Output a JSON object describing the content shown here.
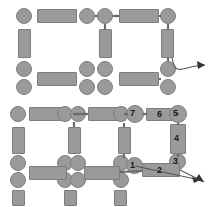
{
  "figure": {
    "background_color": "#ffffff",
    "shape_fill": "#9a9a9a",
    "shape_stroke": "#7d7d7d",
    "connector_color": "#6b6b6b",
    "label_color": "#1a1a1a"
  },
  "panels": [
    {
      "id": "top-panel",
      "name": "upper-layout-diagram",
      "has_labels": false,
      "shapes": [
        {
          "kind": "circle",
          "x": 16,
          "y": 8,
          "w": 16,
          "h": 16
        },
        {
          "kind": "rect",
          "x": 37,
          "y": 9,
          "w": 40,
          "h": 14
        },
        {
          "kind": "circle",
          "x": 79,
          "y": 8,
          "w": 16,
          "h": 16
        },
        {
          "kind": "circle",
          "x": 97,
          "y": 8,
          "w": 16,
          "h": 16
        },
        {
          "kind": "rect",
          "x": 119,
          "y": 9,
          "w": 40,
          "h": 14
        },
        {
          "kind": "circle",
          "x": 160,
          "y": 8,
          "w": 16,
          "h": 16
        },
        {
          "kind": "rect",
          "x": 18,
          "y": 29,
          "w": 13,
          "h": 29
        },
        {
          "kind": "rect",
          "x": 99,
          "y": 29,
          "w": 13,
          "h": 29
        },
        {
          "kind": "rect",
          "x": 161,
          "y": 29,
          "w": 13,
          "h": 29
        },
        {
          "kind": "circle",
          "x": 16,
          "y": 61,
          "w": 16,
          "h": 16
        },
        {
          "kind": "circle",
          "x": 79,
          "y": 61,
          "w": 16,
          "h": 16
        },
        {
          "kind": "circle",
          "x": 97,
          "y": 61,
          "w": 16,
          "h": 16
        },
        {
          "kind": "circle",
          "x": 160,
          "y": 61,
          "w": 16,
          "h": 16
        },
        {
          "kind": "circle",
          "x": 16,
          "y": 79,
          "w": 16,
          "h": 16
        },
        {
          "kind": "circle",
          "x": 79,
          "y": 79,
          "w": 16,
          "h": 16
        },
        {
          "kind": "circle",
          "x": 97,
          "y": 79,
          "w": 16,
          "h": 16
        },
        {
          "kind": "circle",
          "x": 160,
          "y": 79,
          "w": 16,
          "h": 16
        },
        {
          "kind": "rect",
          "x": 37,
          "y": 72,
          "w": 40,
          "h": 14
        },
        {
          "kind": "rect",
          "x": 119,
          "y": 72,
          "w": 40,
          "h": 14
        }
      ],
      "connectors": [
        {
          "name": "top-link-a",
          "x1": 95,
          "y1": 16,
          "x2": 98,
          "y2": 16
        },
        {
          "name": "top-link-b",
          "x1": 113,
          "y1": 16,
          "x2": 119,
          "y2": 16
        },
        {
          "name": "top-link-c",
          "x1": 159,
          "y1": 16,
          "x2": 161,
          "y2": 16
        },
        {
          "name": "stem-mid",
          "x1": 105,
          "y1": 24,
          "x2": 105,
          "y2": 29
        },
        {
          "name": "stem-right",
          "x1": 168,
          "y1": 24,
          "x2": 168,
          "y2": 29
        },
        {
          "name": "stem-right-low",
          "x1": 168,
          "y1": 58,
          "x2": 168,
          "y2": 61
        },
        {
          "name": "link-bottom-right",
          "x1": 159,
          "y1": 79,
          "x2": 161,
          "y2": 79
        }
      ],
      "arrow": {
        "name": "exit-arrow",
        "path": "M 172 58 C 176 78, 182 66, 205 65",
        "head": [
          [
            205,
            65
          ],
          [
            197,
            61
          ],
          [
            198,
            69
          ]
        ]
      }
    },
    {
      "id": "bottom-panel",
      "name": "lower-layout-diagram",
      "has_labels": true,
      "shapes": [
        {
          "kind": "circle",
          "x": 10,
          "y": 106,
          "w": 16,
          "h": 16
        },
        {
          "kind": "rect",
          "x": 29,
          "y": 107,
          "w": 38,
          "h": 14
        },
        {
          "kind": "circle",
          "x": 57,
          "y": 106,
          "w": 16,
          "h": 16
        },
        {
          "kind": "circle",
          "x": 70,
          "y": 106,
          "w": 16,
          "h": 16
        },
        {
          "kind": "rect",
          "x": 88,
          "y": 107,
          "w": 38,
          "h": 14
        },
        {
          "kind": "circle",
          "x": 113,
          "y": 106,
          "w": 16,
          "h": 16
        },
        {
          "kind": "circle",
          "x": 126,
          "y": 105,
          "w": 18,
          "h": 18
        },
        {
          "kind": "rect",
          "x": 146,
          "y": 108,
          "w": 30,
          "h": 13
        },
        {
          "kind": "circle",
          "x": 169,
          "y": 105,
          "w": 18,
          "h": 18
        },
        {
          "kind": "rect",
          "x": 12,
          "y": 127,
          "w": 13,
          "h": 27
        },
        {
          "kind": "rect",
          "x": 68,
          "y": 127,
          "w": 13,
          "h": 27
        },
        {
          "kind": "rect",
          "x": 118,
          "y": 127,
          "w": 13,
          "h": 27
        },
        {
          "kind": "rect",
          "x": 170,
          "y": 124,
          "w": 16,
          "h": 30
        },
        {
          "kind": "circle",
          "x": 10,
          "y": 155,
          "w": 16,
          "h": 16
        },
        {
          "kind": "circle",
          "x": 57,
          "y": 155,
          "w": 16,
          "h": 16
        },
        {
          "kind": "circle",
          "x": 70,
          "y": 155,
          "w": 16,
          "h": 16
        },
        {
          "kind": "circle",
          "x": 113,
          "y": 155,
          "w": 16,
          "h": 16
        },
        {
          "kind": "circle",
          "x": 126,
          "y": 157,
          "w": 17,
          "h": 17
        },
        {
          "kind": "circle",
          "x": 169,
          "y": 153,
          "w": 17,
          "h": 17
        },
        {
          "kind": "circle",
          "x": 10,
          "y": 172,
          "w": 16,
          "h": 16
        },
        {
          "kind": "circle",
          "x": 57,
          "y": 172,
          "w": 16,
          "h": 16
        },
        {
          "kind": "circle",
          "x": 70,
          "y": 172,
          "w": 16,
          "h": 16
        },
        {
          "kind": "circle",
          "x": 113,
          "y": 172,
          "w": 16,
          "h": 16
        },
        {
          "kind": "rect",
          "x": 29,
          "y": 166,
          "w": 38,
          "h": 14
        },
        {
          "kind": "rect",
          "x": 84,
          "y": 166,
          "w": 36,
          "h": 14
        },
        {
          "kind": "rect",
          "x": 142,
          "y": 163,
          "w": 38,
          "h": 14
        },
        {
          "kind": "rect",
          "x": 12,
          "y": 190,
          "w": 13,
          "h": 16
        },
        {
          "kind": "rect",
          "x": 64,
          "y": 190,
          "w": 13,
          "h": 16
        },
        {
          "kind": "rect",
          "x": 114,
          "y": 190,
          "w": 13,
          "h": 16
        }
      ],
      "connectors": [
        {
          "name": "b-link-a",
          "x1": 73,
          "y1": 114,
          "x2": 88,
          "y2": 114
        },
        {
          "name": "b-link-b",
          "x1": 124,
          "y1": 114,
          "x2": 128,
          "y2": 114
        },
        {
          "name": "b-link-c",
          "x1": 143,
          "y1": 114,
          "x2": 147,
          "y2": 114
        },
        {
          "name": "b-link-d",
          "x1": 176,
          "y1": 114,
          "x2": 179,
          "y2": 114
        },
        {
          "name": "b-stem-1",
          "x1": 124,
          "y1": 123,
          "x2": 124,
          "y2": 127
        },
        {
          "name": "b-stem-2",
          "x1": 178,
          "y1": 123,
          "x2": 178,
          "y2": 125
        },
        {
          "name": "b-stem-3",
          "x1": 178,
          "y1": 154,
          "x2": 178,
          "y2": 157
        },
        {
          "name": "b-stem-4",
          "x1": 124,
          "y1": 154,
          "x2": 124,
          "y2": 158
        },
        {
          "name": "b-link-e",
          "x1": 120,
          "y1": 172,
          "x2": 142,
          "y2": 171
        },
        {
          "name": "b-link-f",
          "x1": 74,
          "y1": 122,
          "x2": 74,
          "y2": 127
        }
      ],
      "arrows": [
        {
          "name": "lower-exit-arrow-main",
          "path": "M 180 170 L 204 182",
          "head": [
            [
              204,
              182
            ],
            [
              195,
              180
            ],
            [
              199,
              174
            ]
          ]
        },
        {
          "name": "lower-exit-arrow-secondary",
          "path": "M 135 166 L 200 180",
          "head": [
            [
              200,
              180
            ],
            [
              192,
              177
            ],
            [
              194,
              183
            ]
          ]
        }
      ],
      "labels": [
        {
          "name": "node-label-7",
          "text": "7",
          "x": 130,
          "y": 109
        },
        {
          "name": "node-label-6",
          "text": "6",
          "x": 157,
          "y": 110
        },
        {
          "name": "node-label-5",
          "text": "5",
          "x": 173,
          "y": 109
        },
        {
          "name": "node-label-4",
          "text": "4",
          "x": 174,
          "y": 134
        },
        {
          "name": "node-label-3",
          "text": "3",
          "x": 173,
          "y": 157
        },
        {
          "name": "node-label-2",
          "text": "2",
          "x": 157,
          "y": 166
        },
        {
          "name": "node-label-1",
          "text": "1",
          "x": 130,
          "y": 161
        }
      ]
    }
  ]
}
